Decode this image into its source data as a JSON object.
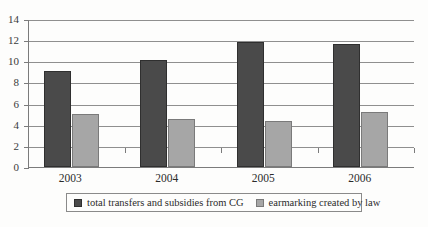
{
  "chart_data": {
    "type": "bar",
    "title": "",
    "subtitle": "",
    "xlabel": "",
    "ylabel": "",
    "categories": [
      "2003",
      "2004",
      "2005",
      "2006"
    ],
    "series": [
      {
        "name": "total transfers and subsidies from CG",
        "color": "#4a4a4a",
        "values": [
          9.1,
          10.1,
          11.8,
          11.65
        ]
      },
      {
        "name": "earmarking created by law",
        "color": "#a6a6a6",
        "values": [
          5.0,
          4.55,
          4.4,
          5.2
        ]
      }
    ],
    "ylim": [
      0,
      14
    ],
    "yticks": [
      0,
      2,
      4,
      6,
      8,
      10,
      12,
      14
    ],
    "ytick_labels": [
      "0",
      "2",
      "4",
      "6",
      "8",
      "10",
      "12",
      "14"
    ],
    "grid": true,
    "legend_position": "bottom"
  },
  "legend": {
    "entries": [
      {
        "label": "total transfers and subsidies from CG",
        "swatch": "series-dark"
      },
      {
        "label": "earmarking created by law",
        "swatch": "series-light"
      }
    ]
  },
  "colors": {
    "series_dark": "#4a4a4a",
    "series_light": "#a6a6a6",
    "axis": "#7b7b7b",
    "grid": "#8f8f8f",
    "background": "#fdfdfc"
  }
}
